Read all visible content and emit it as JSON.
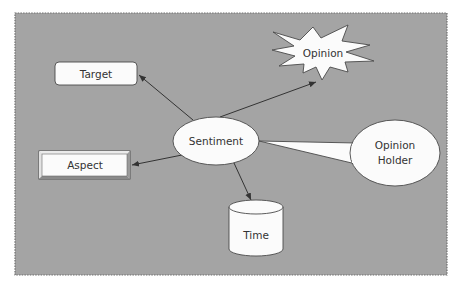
{
  "diagram": {
    "background": "#ffffff",
    "panel": {
      "fill": "#a4a4a4",
      "border": "#6e6e6e"
    },
    "shape_fill": "#fbfbfb",
    "stroke": "#4a4a4a",
    "nodes": {
      "sentiment": {
        "label": "Sentiment",
        "shape": "ellipse"
      },
      "target": {
        "label": "Target",
        "shape": "rounded-rectangle"
      },
      "aspect": {
        "label": "Aspect",
        "shape": "beveled-rectangle"
      },
      "opinion": {
        "label": "Opinion",
        "shape": "starburst"
      },
      "opinion_holder": {
        "label_line1": "Opinion",
        "label_line2": "Holder",
        "shape": "callout-ellipse"
      },
      "time": {
        "label": "Time",
        "shape": "cylinder"
      }
    },
    "edges": [
      {
        "from": "Sentiment",
        "to": "Target",
        "type": "arrow"
      },
      {
        "from": "Sentiment",
        "to": "Opinion",
        "type": "arrow"
      },
      {
        "from": "Sentiment",
        "to": "Aspect",
        "type": "arrow"
      },
      {
        "from": "Sentiment",
        "to": "Time",
        "type": "arrow"
      },
      {
        "from": "Opinion Holder",
        "to": "Sentiment",
        "type": "callout-pointer"
      }
    ]
  }
}
